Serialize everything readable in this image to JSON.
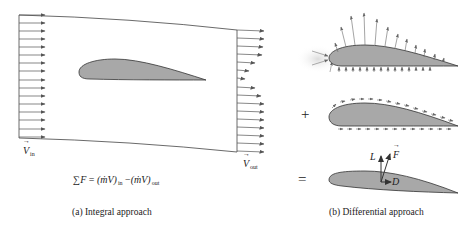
{
  "panel_a": {
    "caption": "(a) Integral approach",
    "inlet_label": {
      "symbol": "V",
      "subscript": "in"
    },
    "outlet_label": {
      "symbol": "V",
      "subscript": "out"
    },
    "equation": {
      "lhs": "∑F",
      "eq": "=",
      "term1": "(ṁV)",
      "term1_sub": "in",
      "minus": "−",
      "term2": "(ṁV)",
      "term2_sub": "out"
    },
    "inlet_arrow_count": 16,
    "outlet_arrow_count": 16
  },
  "panel_b": {
    "caption": "(b) Differential approach",
    "operators": {
      "plus": "+",
      "equals": "="
    },
    "force_labels": {
      "lift": "L",
      "force": "F",
      "drag": "D"
    },
    "rows": [
      "pressure-distribution",
      "shear-stress-distribution",
      "resultant-force"
    ]
  },
  "colors": {
    "airfoil_fill": "#a8a8a8",
    "airfoil_stroke": "#333333",
    "arrow": "#555555",
    "stagnation_glow": "#e6e6e6"
  }
}
